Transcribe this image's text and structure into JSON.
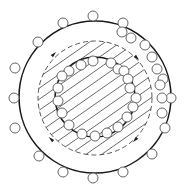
{
  "diagram": {
    "title": "",
    "colors": {
      "stroke": "#1a1a1a",
      "small_circle_stroke": "#555555",
      "hatch": "#444444",
      "background": "#ffffff"
    },
    "outer_circle": {
      "cx": 95,
      "cy": 97,
      "r": 76
    },
    "dashed_circle": {
      "cx": 95,
      "cy": 98,
      "r": 57
    },
    "inner_circle": {
      "cx": 95,
      "cy": 97,
      "r": 40
    },
    "small_circle_radius": 5,
    "outer_small_circles": [
      [
        93,
        16
      ],
      [
        63,
        23
      ],
      [
        123,
        23
      ],
      [
        38,
        42
      ],
      [
        122,
        32
      ],
      [
        131,
        38
      ],
      [
        145,
        45
      ],
      [
        152,
        57
      ],
      [
        157,
        69
      ],
      [
        15,
        68
      ],
      [
        163,
        79
      ],
      [
        14,
        98
      ],
      [
        171,
        98
      ],
      [
        162,
        98
      ],
      [
        160,
        85
      ],
      [
        15,
        128
      ],
      [
        162,
        113
      ],
      [
        165,
        128
      ],
      [
        39,
        156
      ],
      [
        152,
        154
      ],
      [
        63,
        172
      ],
      [
        93,
        178
      ],
      [
        123,
        172
      ]
    ],
    "inner_small_circles": [
      [
        69,
        71
      ],
      [
        81,
        65
      ],
      [
        93,
        61
      ],
      [
        111,
        63
      ],
      [
        118,
        69
      ],
      [
        124,
        71
      ],
      [
        128,
        79
      ],
      [
        130,
        88
      ],
      [
        136,
        98
      ],
      [
        133,
        107
      ],
      [
        127,
        117
      ],
      [
        118,
        127
      ],
      [
        107,
        133
      ],
      [
        95,
        136
      ],
      [
        82,
        134
      ],
      [
        69,
        125
      ],
      [
        62,
        113
      ],
      [
        58,
        101
      ],
      [
        58,
        88
      ],
      [
        62,
        76
      ]
    ],
    "arrows": [
      {
        "x": 54,
        "y": 54,
        "direction": "up-right"
      },
      {
        "x": 137,
        "y": 58,
        "direction": "down-right"
      },
      {
        "x": 51,
        "y": 139,
        "direction": "up-left"
      },
      {
        "x": 135,
        "y": 140,
        "direction": "down-left"
      }
    ],
    "hatch_spacing": 9,
    "hatch_angle_deg": -35
  }
}
